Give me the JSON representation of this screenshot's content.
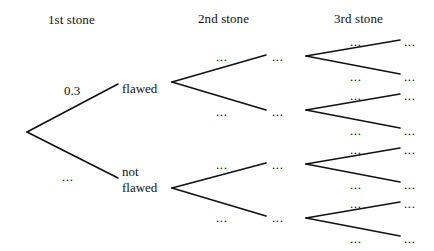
{
  "figure": {
    "type": "probability-tree-diagram",
    "background_color": "#ffffff",
    "line_color": "#111111",
    "text_color": "#111111"
  },
  "columns": [
    {
      "label": "1st stone",
      "x": 48,
      "y": 13
    },
    {
      "label": "2nd stone",
      "x": 198,
      "y": 12
    },
    {
      "label": "3rd stone",
      "x": 334,
      "y": 12
    }
  ],
  "labels": {
    "branch_probability": "0.3",
    "unknown": "...",
    "flawed": "flawed",
    "not_line1": "not",
    "not_line2": "flawed"
  },
  "nodes": {
    "root": {
      "x": 27,
      "y": 132
    },
    "stage1": [
      {
        "name": "flawed",
        "text": "flawed",
        "x": 122,
        "y": 82,
        "edge_label": "0.3",
        "edge_label_x": 64,
        "edge_label_y": 84
      },
      {
        "name": "not-flawed",
        "text": "not\nflawed",
        "x": 122,
        "y": 165,
        "edge_label": "...",
        "edge_label_x": 62,
        "edge_label_y": 170
      }
    ],
    "stage2": [
      {
        "parent": "flawed",
        "vertex_x": 172,
        "vertex_y": 82,
        "end_x": 266,
        "end_y": 55,
        "edge_label": "...",
        "edge_label_x": 216,
        "edge_label_y": 50,
        "node_label": "...",
        "node_label_x": 272,
        "node_label_y": 50
      },
      {
        "parent": "flawed",
        "vertex_x": 172,
        "vertex_y": 82,
        "end_x": 266,
        "end_y": 110,
        "edge_label": "...",
        "edge_label_x": 216,
        "edge_label_y": 105,
        "node_label": "...",
        "node_label_x": 272,
        "node_label_y": 105
      },
      {
        "parent": "not-flawed",
        "vertex_x": 172,
        "vertex_y": 188,
        "end_x": 266,
        "end_y": 163,
        "edge_label": "...",
        "edge_label_x": 216,
        "edge_label_y": 158,
        "node_label": "...",
        "node_label_x": 272,
        "node_label_y": 158
      },
      {
        "parent": "not-flawed",
        "vertex_x": 172,
        "vertex_y": 188,
        "end_x": 266,
        "end_y": 216,
        "edge_label": "...",
        "edge_label_x": 216,
        "edge_label_y": 211,
        "node_label": "...",
        "node_label_x": 272,
        "node_label_y": 211
      }
    ],
    "stage3": [
      {
        "vertex_x": 306,
        "vertex_y": 56,
        "end_x": 400,
        "end_y": 40,
        "edge_label": "...",
        "edge_label_x": 350,
        "edge_label_y": 35,
        "leaf_label": "...",
        "leaf_label_x": 404,
        "leaf_label_y": 35
      },
      {
        "vertex_x": 306,
        "vertex_y": 56,
        "end_x": 400,
        "end_y": 74,
        "edge_label": "...",
        "edge_label_x": 350,
        "edge_label_y": 70,
        "leaf_label": "...",
        "leaf_label_x": 404,
        "leaf_label_y": 70
      },
      {
        "vertex_x": 306,
        "vertex_y": 110,
        "end_x": 400,
        "end_y": 94,
        "edge_label": "...",
        "edge_label_x": 350,
        "edge_label_y": 89,
        "leaf_label": "...",
        "leaf_label_x": 404,
        "leaf_label_y": 89
      },
      {
        "vertex_x": 306,
        "vertex_y": 110,
        "end_x": 400,
        "end_y": 128,
        "edge_label": "...",
        "edge_label_x": 350,
        "edge_label_y": 124,
        "leaf_label": "...",
        "leaf_label_x": 404,
        "leaf_label_y": 124
      },
      {
        "vertex_x": 306,
        "vertex_y": 164,
        "end_x": 400,
        "end_y": 148,
        "edge_label": "...",
        "edge_label_x": 350,
        "edge_label_y": 143,
        "leaf_label": "...",
        "leaf_label_x": 404,
        "leaf_label_y": 143
      },
      {
        "vertex_x": 306,
        "vertex_y": 164,
        "end_x": 400,
        "end_y": 182,
        "edge_label": "...",
        "edge_label_x": 350,
        "edge_label_y": 178,
        "leaf_label": "...",
        "leaf_label_x": 404,
        "leaf_label_y": 178
      },
      {
        "vertex_x": 306,
        "vertex_y": 218,
        "end_x": 400,
        "end_y": 202,
        "edge_label": "...",
        "edge_label_x": 350,
        "edge_label_y": 197,
        "leaf_label": "...",
        "leaf_label_x": 404,
        "leaf_label_y": 197
      },
      {
        "vertex_x": 306,
        "vertex_y": 218,
        "end_x": 400,
        "end_y": 236,
        "edge_label": "...",
        "edge_label_x": 350,
        "edge_label_y": 232,
        "leaf_label": "...",
        "leaf_label_x": 404,
        "leaf_label_y": 232
      }
    ]
  }
}
